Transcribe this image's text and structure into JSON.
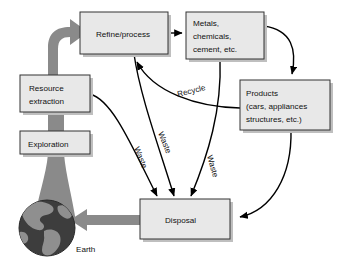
{
  "diagram": {
    "colors": {
      "box_fill": "#e8e8e8",
      "box_stroke": "#333333",
      "box_shadow": "#bfbfbf",
      "arrow_black": "#000000",
      "gray_flow": "#8a8a8a",
      "earth_ocean": "#3d3d3d",
      "earth_land": "#8f8f8f",
      "background": "#ffffff"
    },
    "nodes": [
      {
        "id": "refine-process",
        "label": "Refine/process",
        "lines": [
          "Refine/process"
        ],
        "x": 80,
        "y": 12,
        "w": 88,
        "h": 42
      },
      {
        "id": "metals-chemicals",
        "label": "Metals, chemicals, cement, etc.",
        "lines": [
          "Metals,",
          "chemicals,",
          "cement, etc."
        ],
        "x": 186,
        "y": 12,
        "w": 78,
        "h": 47
      },
      {
        "id": "products",
        "label": "Products (cars, appliances structures, etc.)",
        "lines": [
          "Products",
          "(cars, appliances",
          "structures, etc.)"
        ],
        "x": 240,
        "y": 80,
        "w": 90,
        "h": 50
      },
      {
        "id": "resource-extraction",
        "label": "Resource extraction",
        "lines": [
          "Resource",
          "extraction"
        ],
        "x": 20,
        "y": 75,
        "w": 70,
        "h": 37
      },
      {
        "id": "exploration",
        "label": "Exploration",
        "lines": [
          "Exploration"
        ],
        "x": 20,
        "y": 131,
        "w": 70,
        "h": 23
      },
      {
        "id": "disposal",
        "label": "Disposal",
        "lines": [
          "Disposal"
        ],
        "x": 140,
        "y": 199,
        "w": 90,
        "h": 40
      }
    ],
    "edge_labels": [
      {
        "id": "recycle",
        "text": "Recycle",
        "x": 178,
        "y": 97,
        "rotate": -14
      },
      {
        "id": "waste-left",
        "text": "Waste",
        "x": 134,
        "y": 148,
        "rotate": 68
      },
      {
        "id": "waste-middle",
        "text": "Waste",
        "x": 158,
        "y": 133,
        "rotate": 68
      },
      {
        "id": "waste-right",
        "text": "Waste",
        "x": 207,
        "y": 156,
        "rotate": 74
      }
    ],
    "earth": {
      "label": "Earth",
      "cx": 47,
      "cy": 228,
      "r": 28,
      "label_x": 76,
      "label_y": 252
    }
  }
}
